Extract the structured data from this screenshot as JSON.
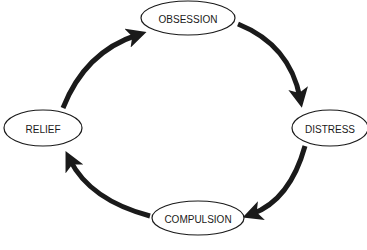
{
  "diagram": {
    "type": "cycle",
    "colors": {
      "stroke": "#1a1a1a",
      "background": "#ffffff",
      "fill": "#ffffff"
    },
    "nodes": [
      {
        "id": "obsession",
        "label": "OBSESSION"
      },
      {
        "id": "distress",
        "label": "DISTRESS"
      },
      {
        "id": "compulsion",
        "label": "COMPULSION"
      },
      {
        "id": "relief",
        "label": "RELIEF"
      }
    ],
    "edges": [
      {
        "from": "obsession",
        "to": "distress"
      },
      {
        "from": "distress",
        "to": "compulsion"
      },
      {
        "from": "compulsion",
        "to": "relief"
      },
      {
        "from": "relief",
        "to": "obsession"
      }
    ]
  }
}
